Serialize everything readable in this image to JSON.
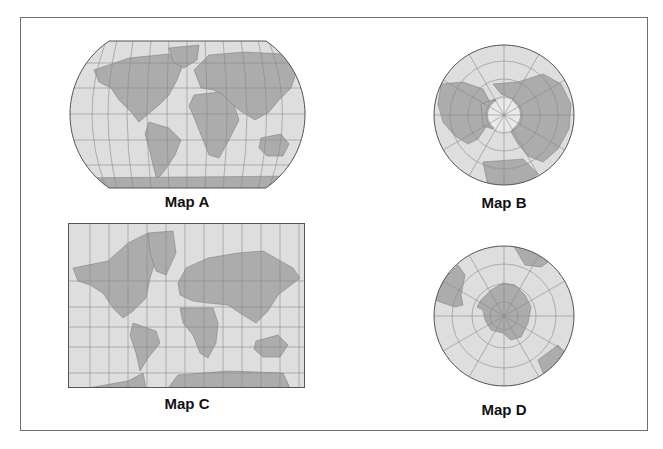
{
  "figure": {
    "maps": [
      {
        "id": "A",
        "label": "Map A",
        "projection_shape": "rounded-oval world map"
      },
      {
        "id": "B",
        "label": "Map B",
        "projection_shape": "circular north polar view"
      },
      {
        "id": "C",
        "label": "Map C",
        "projection_shape": "rectangular world map"
      },
      {
        "id": "D",
        "label": "Map D",
        "projection_shape": "circular south polar view"
      }
    ]
  },
  "colors": {
    "ocean": "#dedede",
    "land": "#acacac",
    "grid": "#8a8a8a",
    "outline": "#555555",
    "frame": "#6e6e6e"
  }
}
